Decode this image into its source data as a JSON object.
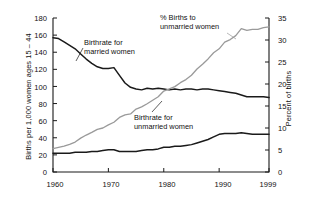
{
  "chart_data": {
    "type": "line",
    "title": "",
    "xlabel": "",
    "ylabel": "Births per 1,000 women ages 15 – 44",
    "ylabel_right": "Percent of births",
    "xlim": [
      1960,
      1999
    ],
    "ylim": [
      0,
      180
    ],
    "ylim_right": [
      0,
      35
    ],
    "grid": false,
    "legend_position": "inline-annotations",
    "xticks": [
      "1960",
      "1970",
      "1980",
      "1990",
      "1999"
    ],
    "xtick_values": [
      1960,
      1970,
      1980,
      1990,
      1999
    ],
    "yticks_left": [
      "0",
      "20",
      "40",
      "60",
      "80",
      "100",
      "120",
      "140",
      "160",
      "180"
    ],
    "ytick_values_left": [
      0,
      20,
      40,
      60,
      80,
      100,
      120,
      140,
      160,
      180
    ],
    "yticks_right": [
      "0",
      "5",
      "10",
      "15",
      "20",
      "25",
      "30",
      "35"
    ],
    "ytick_values_right": [
      0,
      5,
      10,
      15,
      20,
      25,
      30,
      35
    ],
    "x": [
      1960,
      1961,
      1962,
      1963,
      1964,
      1965,
      1966,
      1967,
      1968,
      1969,
      1970,
      1971,
      1972,
      1973,
      1974,
      1975,
      1976,
      1977,
      1978,
      1979,
      1980,
      1981,
      1982,
      1983,
      1984,
      1985,
      1986,
      1987,
      1988,
      1989,
      1990,
      1991,
      1992,
      1993,
      1994,
      1995,
      1996,
      1997,
      1998,
      1999
    ],
    "series": [
      {
        "name": "Birthrate for married women",
        "axis": "left",
        "color": "#1a1a1a",
        "values": [
          157,
          156,
          152,
          148,
          144,
          138,
          132,
          127,
          123,
          121,
          121,
          122,
          113,
          104,
          99,
          97,
          96,
          98,
          97,
          98,
          97,
          96,
          97,
          96,
          97,
          97,
          96,
          97,
          97,
          96,
          95,
          94,
          93,
          92,
          90,
          88,
          88,
          88,
          88,
          87
        ]
      },
      {
        "name": "Birthrate for unmarried women",
        "axis": "left",
        "color": "#1a1a1a",
        "values": [
          22,
          22,
          22,
          22,
          23,
          23,
          23,
          24,
          24,
          25,
          26,
          26,
          24,
          24,
          24,
          24,
          25,
          26,
          26,
          27,
          29,
          29,
          30,
          30,
          31,
          32,
          34,
          36,
          38,
          41,
          44,
          45,
          45,
          45,
          46,
          45,
          44,
          44,
          44,
          44
        ]
      },
      {
        "name": "% Births to unmarried women",
        "axis": "right",
        "color": "#9a9a9a",
        "values": [
          5.3,
          5.6,
          5.9,
          6.3,
          6.8,
          7.7,
          8.4,
          9.0,
          9.7,
          10.0,
          10.7,
          11.3,
          12.4,
          13.0,
          13.2,
          14.3,
          14.8,
          15.5,
          16.3,
          17.1,
          18.4,
          18.9,
          19.4,
          20.3,
          21.0,
          22.0,
          23.4,
          24.5,
          25.7,
          27.1,
          28.0,
          29.5,
          30.1,
          31.0,
          32.6,
          32.2,
          32.4,
          32.4,
          32.8,
          33.0
        ]
      }
    ]
  },
  "annotations": [
    {
      "id": "married",
      "text_line1": "Birthrate for",
      "text_line2": "married women"
    },
    {
      "id": "unmarried",
      "text_line1": "Birthrate for",
      "text_line2": "unmarried women"
    },
    {
      "id": "pct",
      "text_line1": "% Births to",
      "text_line2": "unmarried women"
    }
  ]
}
